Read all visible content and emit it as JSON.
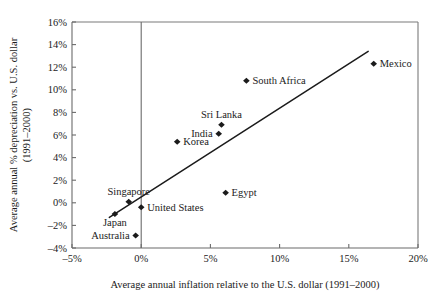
{
  "chart_data": {
    "type": "scatter",
    "title": "",
    "xlabel": "Average annual inflation relative to the U.S. dollar (1991–2000)",
    "ylabel": "Average annual % depreciation vs. U.S. dollar (1991–2000)",
    "ylabel_line1": "Average annual % depreciation vs. U.S. dollar",
    "ylabel_line2": "(1991–2000)",
    "xlim": [
      -5,
      20
    ],
    "ylim": [
      -4,
      16
    ],
    "xticks": [
      "-5%",
      "0%",
      "5%",
      "10%",
      "15%",
      "20%"
    ],
    "xtick_values": [
      -5,
      0,
      5,
      10,
      15,
      20
    ],
    "yticks": [
      "-4%",
      "-2%",
      "0%",
      "2%",
      "4%",
      "6%",
      "8%",
      "10%",
      "12%",
      "14%",
      "16%"
    ],
    "ytick_values": [
      -4,
      -2,
      0,
      2,
      4,
      6,
      8,
      10,
      12,
      14,
      16
    ],
    "grid": false,
    "legend": "none",
    "marker_shape": "diamond",
    "marker_color": "#1b1b1b",
    "trendline": {
      "visible": true,
      "color": "#1b1b1b",
      "x_start": -2.3,
      "y_start": -1.3,
      "x_end": 16.4,
      "y_end": 13.4
    },
    "points": [
      {
        "name": "Mexico",
        "x": 16.8,
        "y": 12.3,
        "label_pos": "right"
      },
      {
        "name": "South Africa",
        "x": 7.6,
        "y": 10.8,
        "label_pos": "right"
      },
      {
        "name": "Sri Lanka",
        "x": 5.8,
        "y": 6.9,
        "label_pos": "above"
      },
      {
        "name": "India",
        "x": 5.6,
        "y": 6.1,
        "label_pos": "left"
      },
      {
        "name": "Korea",
        "x": 2.6,
        "y": 5.4,
        "label_pos": "right"
      },
      {
        "name": "Egypt",
        "x": 6.1,
        "y": 0.9,
        "label_pos": "right"
      },
      {
        "name": "Singapore",
        "x": -0.9,
        "y": 0.1,
        "label_pos": "above"
      },
      {
        "name": "United States",
        "x": 0.0,
        "y": -0.4,
        "label_pos": "right"
      },
      {
        "name": "Japan",
        "x": -1.9,
        "y": -1.0,
        "label_pos": "below"
      },
      {
        "name": "Australia",
        "x": -0.4,
        "y": -2.9,
        "label_pos": "left"
      }
    ]
  }
}
